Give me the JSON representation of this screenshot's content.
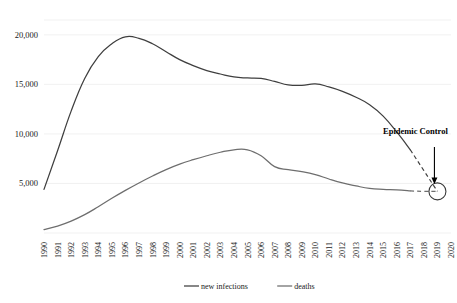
{
  "chart_data": {
    "type": "line",
    "title": "",
    "xlabel": "",
    "ylabel": "",
    "grid": true,
    "legend_position": "bottom",
    "ylim": [
      0,
      21500
    ],
    "yticks": [
      5000,
      10000,
      15000,
      20000
    ],
    "ytick_labels": [
      "5,000",
      "10,000",
      "15,000",
      "20,000"
    ],
    "categories": [
      "1990",
      "1991",
      "1992",
      "1993",
      "1994",
      "1995",
      "1996",
      "1997",
      "1998",
      "1999",
      "2000",
      "2001",
      "2002",
      "2003",
      "2004",
      "2005",
      "2006",
      "2007",
      "2008",
      "2009",
      "2010",
      "2011",
      "2012",
      "2013",
      "2014",
      "2015",
      "2016",
      "2017",
      "2018",
      "2019",
      "2020"
    ],
    "series": [
      {
        "name": "new infections",
        "color": "#3f3f3f",
        "solid_through": "2017",
        "projected_from": "2017",
        "values": [
          4400,
          8300,
          12300,
          15600,
          17800,
          19100,
          19800,
          19650,
          19100,
          18300,
          17500,
          16900,
          16400,
          16050,
          15750,
          15650,
          15600,
          15300,
          14950,
          14900,
          15050,
          14750,
          14300,
          13700,
          12950,
          11800,
          10200,
          8400,
          6300,
          4200,
          null
        ]
      },
      {
        "name": "deaths",
        "color": "#6e6e6e",
        "solid_through": "2017",
        "projected_from": "2017",
        "values": [
          350,
          700,
          1200,
          1850,
          2650,
          3500,
          4300,
          5050,
          5750,
          6400,
          6950,
          7400,
          7800,
          8150,
          8400,
          8400,
          7800,
          6700,
          6400,
          6200,
          5900,
          5450,
          5050,
          4750,
          4500,
          4400,
          4350,
          4250,
          4200,
          4200,
          null
        ]
      }
    ],
    "annotations": [
      {
        "name": "epidemic-control",
        "label": "Epidemic Control",
        "target_year": "2019",
        "target_value": 4200,
        "marker": "circle",
        "arrow": "down"
      }
    ]
  },
  "legend": {
    "items": [
      {
        "label": "new infections",
        "color": "#3f3f3f"
      },
      {
        "label": "deaths",
        "color": "#6e6e6e"
      }
    ]
  }
}
